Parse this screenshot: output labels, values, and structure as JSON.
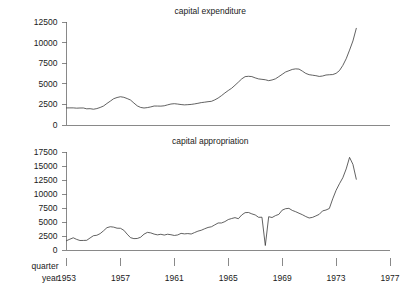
{
  "figure": {
    "width": 418,
    "height": 291,
    "background": "#ffffff",
    "line_color": "#3a3a3a",
    "axis_color": "#6b6b6b",
    "text_color": "#1a1a1a",
    "axis_row_labels": {
      "quarter": "quarter",
      "year": "year"
    }
  },
  "chart_data": [
    {
      "type": "line",
      "title": "capital expenditure",
      "xlabel": "year",
      "ylabel": "",
      "grid": false,
      "legend": "none",
      "xlim": [
        1953.0,
        1977.0
      ],
      "ylim": [
        0,
        12500
      ],
      "yticks": [
        0,
        2500,
        5000,
        7500,
        10000,
        12500
      ],
      "ytick_labels": [
        "0",
        "2500",
        "5000",
        "7500",
        "10000",
        "12500"
      ],
      "xticks": [
        1953,
        1957,
        1961,
        1965,
        1969,
        1973,
        1977
      ],
      "xtick_labels": [
        "1953",
        "1957",
        "1961",
        "1965",
        "1969",
        "1973",
        "1977"
      ],
      "x": [
        1953.0,
        1953.25,
        1953.5,
        1953.75,
        1954.0,
        1954.25,
        1954.5,
        1954.75,
        1955.0,
        1955.25,
        1955.5,
        1955.75,
        1956.0,
        1956.25,
        1956.5,
        1956.75,
        1957.0,
        1957.25,
        1957.5,
        1957.75,
        1958.0,
        1958.25,
        1958.5,
        1958.75,
        1959.0,
        1959.25,
        1959.5,
        1959.75,
        1960.0,
        1960.25,
        1960.5,
        1960.75,
        1961.0,
        1961.25,
        1961.5,
        1961.75,
        1962.0,
        1962.25,
        1962.5,
        1962.75,
        1963.0,
        1963.25,
        1963.5,
        1963.75,
        1964.0,
        1964.25,
        1964.5,
        1964.75,
        1965.0,
        1965.25,
        1965.5,
        1965.75,
        1966.0,
        1966.25,
        1966.5,
        1966.75,
        1967.0,
        1967.25,
        1967.5,
        1967.75,
        1968.0,
        1968.25,
        1968.5,
        1968.75,
        1969.0,
        1969.25,
        1969.5,
        1969.75,
        1970.0,
        1970.25,
        1970.5,
        1970.75,
        1971.0,
        1971.25,
        1971.5,
        1971.75,
        1972.0,
        1972.25,
        1972.5,
        1972.75,
        1973.0,
        1973.25,
        1973.5,
        1973.75,
        1974.0,
        1974.25,
        1974.5
      ],
      "values": [
        2072,
        2077,
        2078,
        2043,
        2062,
        2067,
        1964,
        1981,
        1914,
        1991,
        2129,
        2309,
        2614,
        2896,
        3189,
        3336,
        3430,
        3363,
        3209,
        3029,
        2668,
        2321,
        2132,
        2063,
        2114,
        2195,
        2303,
        2300,
        2290,
        2331,
        2443,
        2545,
        2586,
        2540,
        2482,
        2442,
        2469,
        2498,
        2560,
        2632,
        2719,
        2769,
        2830,
        2873,
        3049,
        3272,
        3563,
        3888,
        4186,
        4456,
        4823,
        5202,
        5592,
        5869,
        5911,
        5876,
        5717,
        5592,
        5543,
        5490,
        5381,
        5464,
        5602,
        5870,
        6148,
        6428,
        6585,
        6744,
        6812,
        6784,
        6536,
        6262,
        6107,
        6045,
        5985,
        5894,
        5945,
        6067,
        6099,
        6122,
        6270,
        6602,
        7229,
        8041,
        9088,
        10202,
        11731
      ]
    },
    {
      "type": "line",
      "title": "capital appropriation",
      "xlabel": "year",
      "ylabel": "",
      "grid": false,
      "legend": "none",
      "xlim": [
        1953.0,
        1977.0
      ],
      "ylim": [
        0,
        17500
      ],
      "yticks": [
        0,
        2500,
        5000,
        7500,
        10000,
        12500,
        15000,
        17500
      ],
      "ytick_labels": [
        "0",
        "2500",
        "5000",
        "7500",
        "10000",
        "12500",
        "15000",
        "17500"
      ],
      "xticks": [
        1953,
        1957,
        1961,
        1965,
        1969,
        1973,
        1977
      ],
      "xtick_labels": [
        "1953",
        "1957",
        "1961",
        "1965",
        "1969",
        "1973",
        "1977"
      ],
      "x": [
        1953.0,
        1953.25,
        1953.5,
        1953.75,
        1954.0,
        1954.25,
        1954.5,
        1954.75,
        1955.0,
        1955.25,
        1955.5,
        1955.75,
        1956.0,
        1956.25,
        1956.5,
        1956.75,
        1957.0,
        1957.25,
        1957.5,
        1957.75,
        1958.0,
        1958.25,
        1958.5,
        1958.75,
        1959.0,
        1959.25,
        1959.5,
        1959.75,
        1960.0,
        1960.25,
        1960.5,
        1960.75,
        1961.0,
        1961.25,
        1961.5,
        1961.75,
        1962.0,
        1962.25,
        1962.5,
        1962.75,
        1963.0,
        1963.25,
        1963.5,
        1963.75,
        1964.0,
        1964.25,
        1964.5,
        1964.75,
        1965.0,
        1965.25,
        1965.5,
        1965.75,
        1966.0,
        1966.25,
        1966.5,
        1966.75,
        1967.0,
        1967.25,
        1967.5,
        1967.75,
        1968.0,
        1968.25,
        1968.5,
        1968.75,
        1969.0,
        1969.25,
        1969.5,
        1969.75,
        1970.0,
        1970.25,
        1970.5,
        1970.75,
        1971.0,
        1971.25,
        1971.5,
        1971.75,
        1972.0,
        1972.25,
        1972.5,
        1972.75,
        1973.0,
        1973.25,
        1973.5,
        1973.75,
        1974.0,
        1974.25,
        1974.5
      ],
      "values": [
        1660,
        1926,
        2181,
        1897,
        1695,
        1705,
        1731,
        2151,
        2556,
        2631,
        2933,
        3437,
        3990,
        4157,
        4084,
        3894,
        3878,
        3533,
        2829,
        2203,
        2028,
        2057,
        2281,
        2829,
        3144,
        3055,
        2839,
        2706,
        2808,
        2666,
        2814,
        2727,
        2595,
        2687,
        2966,
        2877,
        2934,
        2858,
        3113,
        3364,
        3529,
        3791,
        4027,
        4146,
        4489,
        4823,
        4826,
        5067,
        5435,
        5622,
        5778,
        5587,
        6257,
        6669,
        6701,
        6451,
        6261,
        5840,
        5851,
        800,
        5947,
        5800,
        6138,
        6359,
        7115,
        7376,
        7437,
        7068,
        6840,
        6564,
        6302,
        5976,
        5719,
        5824,
        6087,
        6369,
        6986,
        7140,
        7413,
        9135,
        10657,
        11833,
        12908,
        14479,
        16541,
        15293,
        12638
      ]
    }
  ]
}
